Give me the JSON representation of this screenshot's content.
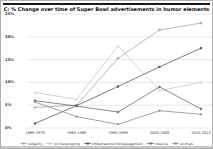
{
  "window": {
    "background": "#ffffff",
    "frame_border": "#b0b0b0",
    "rule_color": "#1a1a1a"
  },
  "chart_data": {
    "type": "line",
    "title": "C: % Change over time of Super Bowl advertisements in humor elements",
    "categories": [
      "1969-1979",
      "1980-1989",
      "1990-1999",
      "2000-2009",
      "2010-2012"
    ],
    "series": [
      {
        "name": "Vulgarity",
        "color": "#a8a8a8",
        "marker": "diamond",
        "values": [
          4.5,
          5.0,
          15.3,
          21.5,
          23.0
        ]
      },
      {
        "name": "All Stereotyping",
        "color": "#c6c6c6",
        "marker": "triangle",
        "values": [
          7.8,
          6.3,
          18.0,
          8.2,
          10.0
        ]
      },
      {
        "name": "Embarrassment/Disparagement",
        "color": "#5a5a5a",
        "marker": "square",
        "values": [
          1.0,
          4.9,
          9.1,
          13.4,
          17.5
        ]
      },
      {
        "name": "Violence",
        "color": "#6e6e6e",
        "marker": "diamond",
        "values": [
          6.0,
          4.8,
          3.5,
          9.0,
          4.2
        ]
      },
      {
        "name": "Animals",
        "color": "#8a8a8a",
        "marker": "circle",
        "values": [
          5.7,
          2.5,
          0.8,
          3.8,
          3.0
        ]
      }
    ],
    "ylabel": "",
    "xlabel": "",
    "ylim": [
      0,
      25
    ],
    "ytick_step": 5,
    "yticks": [
      "0%",
      "5%",
      "10%",
      "15%",
      "20%",
      "25%"
    ],
    "grid": true,
    "gridline_color": "#d9d9d9",
    "legend_position": "bottom"
  }
}
